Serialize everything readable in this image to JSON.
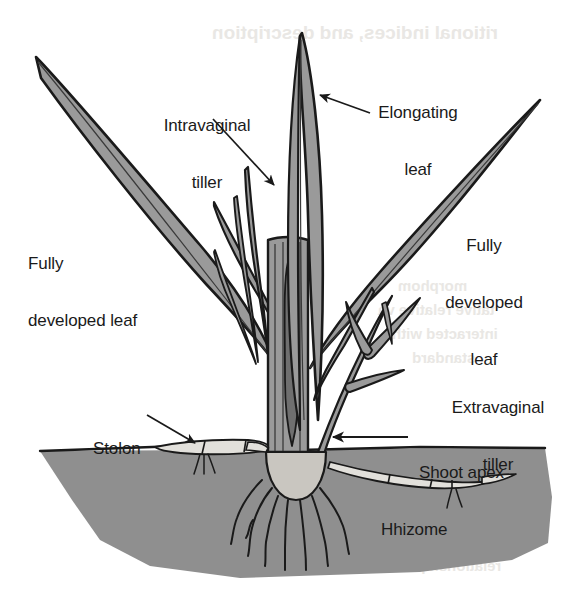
{
  "figure": {
    "background_color": "#ffffff",
    "width": 588,
    "height": 596
  },
  "colors": {
    "leaf_fill": "#9a9a9a",
    "leaf_outline": "#1a1a1a",
    "soil_fill": "#8f8f8f",
    "apex_fill": "#c9c6c0",
    "stolon_fill": "#e2e0db",
    "label_text": "#1a1a1a",
    "bleed_text": "#e9e7e4"
  },
  "labels": {
    "intravaginal_tiller": {
      "line1": "Intravaginal",
      "line2": "tiller"
    },
    "elongating_leaf": {
      "line1": "Elongating",
      "line2": "leaf"
    },
    "fully_developed_leaf_left": {
      "line1": "Fully",
      "line2": "developed leaf"
    },
    "fully_developed_leaf_right": {
      "line1": "Fully",
      "line2": "developed",
      "line3": "leaf"
    },
    "extravaginal_tiller": {
      "line1": "Extravaginal",
      "line2": "tiller"
    },
    "stolon": {
      "line1": "Stolon"
    },
    "shoot_apex": {
      "line1": "Shoot apex"
    },
    "rhizome": {
      "line1": "Hhizome"
    }
  },
  "bleed_through": {
    "top": "ritional indices, and description",
    "mid1": "morphom",
    "mid2": "tative relative va",
    "mid3": "interacted with",
    "mid4": "standard",
    "low1": "ryegrass",
    "low2": "relationships"
  },
  "structures": [
    {
      "name": "elongating-leaf",
      "kind": "leaf",
      "description": "central tall erect blade"
    },
    {
      "name": "fully-developed-leaf-left",
      "kind": "leaf",
      "description": "long blade angled up-left"
    },
    {
      "name": "fully-developed-leaf-right",
      "kind": "leaf",
      "description": "long blade angled up-right"
    },
    {
      "name": "intravaginal-tiller",
      "kind": "tiller",
      "description": "small shoots emerging inside sheath"
    },
    {
      "name": "extravaginal-tiller",
      "kind": "tiller",
      "description": "branching shoot emerging through the sheath"
    },
    {
      "name": "pseudostem",
      "kind": "stem",
      "description": "sheath column above the apex"
    },
    {
      "name": "shoot-apex",
      "kind": "apex",
      "description": "dome-shaped crown at soil line"
    },
    {
      "name": "roots",
      "kind": "roots",
      "description": "fibrous roots below the apex"
    },
    {
      "name": "stolon",
      "kind": "stolon",
      "description": "horizontal above-ground runner to the left"
    },
    {
      "name": "rhizome",
      "kind": "rhizome",
      "description": "horizontal below-ground stem to the right"
    },
    {
      "name": "soil-block",
      "kind": "soil",
      "description": "gray soil cross-section block"
    }
  ]
}
